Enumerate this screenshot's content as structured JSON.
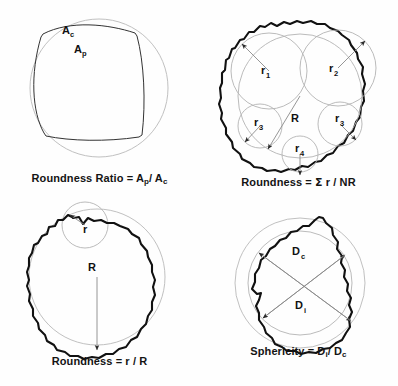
{
  "figure": {
    "background_color": "#fefefe",
    "outline_color": "#111111",
    "reference_circle_color": "#b9b9b9",
    "arrow_color": "#8a8a8a"
  },
  "panels": [
    {
      "id": "roundness-ratio",
      "caption_prefix": "Roundness Ratio = A",
      "caption_sub1": "p",
      "caption_mid": "/ A",
      "caption_sub2": "c",
      "caption_full": "Roundness Ratio = Ap/ Ac",
      "labels": [
        {
          "name": "area-circumscribed",
          "text": "A",
          "sub": "c"
        },
        {
          "name": "area-particle",
          "text": "A",
          "sub": "p"
        }
      ]
    },
    {
      "id": "roundness-sum",
      "caption_prefix": "Roundness = ",
      "caption_sigma": "Σ",
      "caption_mid": " r / NR",
      "caption_full": "Roundness = Σ r / NR",
      "labels": [
        {
          "name": "corner-radius-1",
          "text": "r",
          "sub": "1"
        },
        {
          "name": "corner-radius-2",
          "text": "r",
          "sub": "2"
        },
        {
          "name": "corner-radius-3-left",
          "text": "r",
          "sub": "3"
        },
        {
          "name": "corner-radius-3-right",
          "text": "r",
          "sub": "3"
        },
        {
          "name": "corner-radius-4",
          "text": "r",
          "sub": "4"
        },
        {
          "name": "inscribed-radius",
          "text": "R",
          "sub": ""
        }
      ]
    },
    {
      "id": "roundness-rr",
      "caption_prefix": "Roundness = r / R",
      "caption_full": "Roundness = r / R",
      "labels": [
        {
          "name": "corner-radius",
          "text": "r",
          "sub": ""
        },
        {
          "name": "inscribed-radius",
          "text": "R",
          "sub": ""
        }
      ]
    },
    {
      "id": "sphericity",
      "caption_prefix": "Sphericity = D",
      "caption_sub1": "i",
      "caption_mid": "/ D",
      "caption_sub2": "c",
      "caption_full": "Sphericity = Di/ Dc",
      "labels": [
        {
          "name": "diameter-circumscribed",
          "text": "D",
          "sub": "c"
        },
        {
          "name": "diameter-inscribed",
          "text": "D",
          "sub": "i"
        }
      ]
    }
  ]
}
